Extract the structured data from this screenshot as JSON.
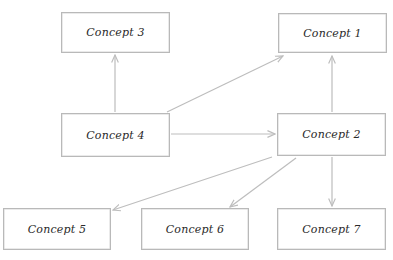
{
  "diagram": {
    "type": "concept-map",
    "colors": {
      "edge": "#bdbdbd",
      "node_border": "#b9b9b9",
      "text": "#2a2a2a",
      "background": "#ffffff"
    },
    "nodes": [
      {
        "id": "c3",
        "label": "Concept 3",
        "x": 61,
        "y": 12,
        "w": 109,
        "h": 41
      },
      {
        "id": "c1",
        "label": "Concept 1",
        "x": 278,
        "y": 13,
        "w": 109,
        "h": 40
      },
      {
        "id": "c4",
        "label": "Concept 4",
        "x": 61,
        "y": 113,
        "w": 109,
        "h": 44
      },
      {
        "id": "c2",
        "label": "Concept 2",
        "x": 277,
        "y": 113,
        "w": 109,
        "h": 43
      },
      {
        "id": "c5",
        "label": "Concept 5",
        "x": 3,
        "y": 208,
        "w": 108,
        "h": 42
      },
      {
        "id": "c6",
        "label": "Concept 6",
        "x": 141,
        "y": 208,
        "w": 108,
        "h": 42
      },
      {
        "id": "c7",
        "label": "Concept 7",
        "x": 277,
        "y": 208,
        "w": 109,
        "h": 42
      }
    ],
    "edges": [
      {
        "from": "Concept 4",
        "to": "Concept 3"
      },
      {
        "from": "Concept 4",
        "to": "Concept 1"
      },
      {
        "from": "Concept 4",
        "to": "Concept 2"
      },
      {
        "from": "Concept 2",
        "to": "Concept 1"
      },
      {
        "from": "Concept 2",
        "to": "Concept 5"
      },
      {
        "from": "Concept 2",
        "to": "Concept 6"
      },
      {
        "from": "Concept 2",
        "to": "Concept 7"
      }
    ]
  }
}
